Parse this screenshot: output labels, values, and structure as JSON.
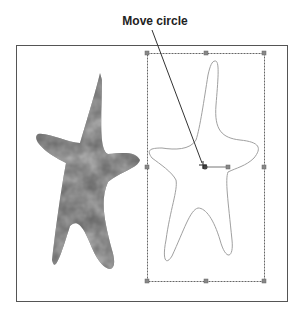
{
  "callout": {
    "label": "Move circle"
  },
  "canvas": {
    "frame_color": "#555555",
    "selection_box_color": "#666666",
    "outline_color": "#9a9a9a",
    "texture_colors": [
      "#4a4a4a",
      "#6f6f6f",
      "#8a8a8a"
    ]
  }
}
